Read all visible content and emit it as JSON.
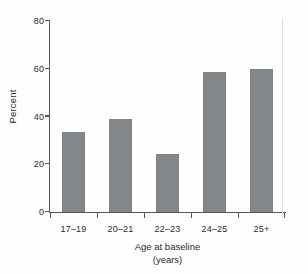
{
  "chart_data": {
    "type": "bar",
    "title": "",
    "subtitle": "",
    "xlabel": "Age at baseline",
    "xlabel_unit": "(years)",
    "ylabel": "Percent",
    "categories": [
      "17–19",
      "20–21",
      "22–23",
      "24–25",
      "25+"
    ],
    "values": [
      33.5,
      39,
      24.3,
      58.6,
      60
    ],
    "ylim": [
      0,
      80
    ],
    "yticks": [
      0,
      20,
      40,
      60,
      80
    ],
    "ytick_labels": [
      "0",
      "20",
      "40",
      "60",
      "80"
    ],
    "grid": false,
    "legend": null,
    "legend_position": "none",
    "series": [
      {
        "name": "Percent",
        "values": [
          33.5,
          39,
          24.3,
          58.6,
          60
        ]
      }
    ],
    "annotations": [],
    "bar_color": "#84878a",
    "axis_color": "#54585c",
    "text_color": "#2b2b2b",
    "background_color": "#fefefe"
  }
}
